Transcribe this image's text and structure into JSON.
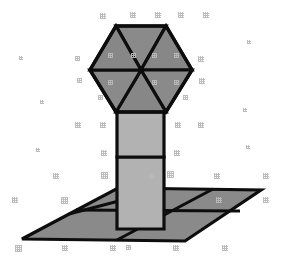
{
  "figure": {
    "caption": "",
    "background_color": "#ffffff",
    "canvas": {
      "width": 282,
      "height": 262
    }
  },
  "palette": {
    "dark_face": "#8a8a8a",
    "mid_face": "#868686",
    "light_face": "#b2b2b2",
    "light_face_alt": "#aaaaaa",
    "outline": "#0d0d0d",
    "speckle": "#b9b9b9",
    "background": "#ffffff"
  },
  "geometry": {
    "hexagon_cap": {
      "label": "hexagonal top face",
      "center": {
        "x": 141,
        "y": 70
      },
      "vertices": [
        {
          "x": 116,
          "y": 26
        },
        {
          "x": 166,
          "y": 26
        },
        {
          "x": 192,
          "y": 70
        },
        {
          "x": 166,
          "y": 112
        },
        {
          "x": 116,
          "y": 112
        },
        {
          "x": 90,
          "y": 70
        }
      ],
      "triangle_count": 6,
      "diagonal_count": 3,
      "outline_width": 3
    },
    "column": {
      "label": "vertical rectangular shaft",
      "left": 117,
      "right": 164,
      "top": 110,
      "bottom": 229,
      "segment_divider_y": 157,
      "segments": 2,
      "outline_width": 3
    },
    "ground_plane": {
      "label": "tiled ground parallelogram",
      "vertices": [
        {
          "x": 22,
          "y": 239
        },
        {
          "x": 118,
          "y": 188
        },
        {
          "x": 261,
          "y": 190
        },
        {
          "x": 185,
          "y": 241
        }
      ],
      "grid_lines_along_depth": 3,
      "grid_lines_along_width": 2,
      "outline_width": 3
    }
  },
  "speckles": {
    "label": "scan dither artifacts",
    "count": 46,
    "points": [
      {
        "x": 100,
        "y": 13,
        "w": 6,
        "h": 6
      },
      {
        "x": 130,
        "y": 12,
        "w": 6,
        "h": 6
      },
      {
        "x": 155,
        "y": 12,
        "w": 6,
        "h": 6
      },
      {
        "x": 178,
        "y": 12,
        "w": 6,
        "h": 6
      },
      {
        "x": 203,
        "y": 12,
        "w": 6,
        "h": 6
      },
      {
        "x": 75,
        "y": 56,
        "w": 5,
        "h": 5
      },
      {
        "x": 198,
        "y": 56,
        "w": 6,
        "h": 6
      },
      {
        "x": 77,
        "y": 78,
        "w": 5,
        "h": 5
      },
      {
        "x": 199,
        "y": 78,
        "w": 6,
        "h": 6
      },
      {
        "x": 75,
        "y": 122,
        "w": 6,
        "h": 6
      },
      {
        "x": 100,
        "y": 122,
        "w": 6,
        "h": 6
      },
      {
        "x": 175,
        "y": 122,
        "w": 6,
        "h": 6
      },
      {
        "x": 198,
        "y": 122,
        "w": 6,
        "h": 6
      },
      {
        "x": 101,
        "y": 150,
        "w": 6,
        "h": 6
      },
      {
        "x": 174,
        "y": 150,
        "w": 6,
        "h": 6
      },
      {
        "x": 53,
        "y": 173,
        "w": 6,
        "h": 6
      },
      {
        "x": 101,
        "y": 172,
        "w": 7,
        "h": 7
      },
      {
        "x": 149,
        "y": 173,
        "w": 6,
        "h": 6
      },
      {
        "x": 167,
        "y": 171,
        "w": 7,
        "h": 7
      },
      {
        "x": 214,
        "y": 173,
        "w": 6,
        "h": 6
      },
      {
        "x": 263,
        "y": 173,
        "w": 6,
        "h": 6
      },
      {
        "x": 12,
        "y": 197,
        "w": 6,
        "h": 6
      },
      {
        "x": 61,
        "y": 197,
        "w": 7,
        "h": 7
      },
      {
        "x": 15,
        "y": 245,
        "w": 7,
        "h": 7
      },
      {
        "x": 62,
        "y": 245,
        "w": 6,
        "h": 6
      },
      {
        "x": 110,
        "y": 245,
        "w": 6,
        "h": 6
      },
      {
        "x": 126,
        "y": 245,
        "w": 5,
        "h": 5
      },
      {
        "x": 173,
        "y": 245,
        "w": 6,
        "h": 6
      },
      {
        "x": 222,
        "y": 245,
        "w": 6,
        "h": 6
      },
      {
        "x": 263,
        "y": 197,
        "w": 6,
        "h": 6
      },
      {
        "x": 216,
        "y": 197,
        "w": 6,
        "h": 6
      },
      {
        "x": 19,
        "y": 56,
        "w": 4,
        "h": 4
      },
      {
        "x": 247,
        "y": 40,
        "w": 4,
        "h": 4
      },
      {
        "x": 40,
        "y": 100,
        "w": 4,
        "h": 4
      },
      {
        "x": 243,
        "y": 108,
        "w": 4,
        "h": 4
      },
      {
        "x": 36,
        "y": 148,
        "w": 4,
        "h": 4
      },
      {
        "x": 246,
        "y": 145,
        "w": 4,
        "h": 4
      },
      {
        "x": 98,
        "y": 95,
        "w": 5,
        "h": 5
      },
      {
        "x": 183,
        "y": 95,
        "w": 5,
        "h": 5
      },
      {
        "x": 108,
        "y": 53,
        "w": 5,
        "h": 5
      },
      {
        "x": 131,
        "y": 53,
        "w": 5,
        "h": 5
      },
      {
        "x": 152,
        "y": 53,
        "w": 5,
        "h": 5
      },
      {
        "x": 174,
        "y": 53,
        "w": 5,
        "h": 5
      },
      {
        "x": 108,
        "y": 80,
        "w": 5,
        "h": 5
      },
      {
        "x": 152,
        "y": 80,
        "w": 5,
        "h": 5
      },
      {
        "x": 174,
        "y": 80,
        "w": 5,
        "h": 5
      }
    ]
  },
  "chart_data": {
    "type": "diagram",
    "parts": [
      {
        "name": "hexagonal cap",
        "faces": 6,
        "shape": "regular hexagon subdivided by three long diagonals",
        "fill": "#8a8a8a"
      },
      {
        "name": "column",
        "faces": 2,
        "shape": "vertical rectangle split by one horizontal edge",
        "fill": "#b2b2b2"
      },
      {
        "name": "ground plane",
        "faces": 9,
        "shape": "parallelogram tiled 3 by 3",
        "fill": "#8a8a8a"
      }
    ]
  }
}
